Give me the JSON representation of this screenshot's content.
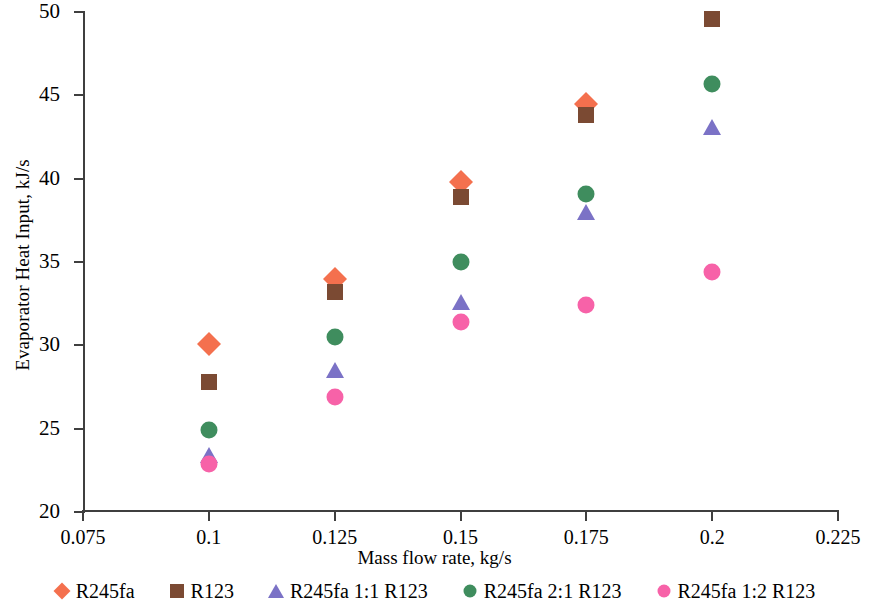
{
  "chart_data": {
    "type": "scatter",
    "title": "",
    "xlabel": "Mass flow rate, kg/s",
    "ylabel": "Evaporator Heat Input, kJ/s",
    "xlim": [
      0.075,
      0.225
    ],
    "ylim": [
      20,
      50
    ],
    "xticks": [
      "0.075",
      "0.1",
      "0.125",
      "0.15",
      "0.175",
      "0.2",
      "0.225"
    ],
    "xtick_values": [
      0.075,
      0.1,
      0.125,
      0.15,
      0.175,
      0.2,
      0.225
    ],
    "yticks": [
      "20",
      "25",
      "30",
      "35",
      "40",
      "45",
      "50"
    ],
    "ytick_values": [
      20,
      25,
      30,
      35,
      40,
      45,
      50
    ],
    "grid": false,
    "legend_position": "bottom",
    "x": [
      0.1,
      0.125,
      0.15,
      0.175,
      0.2
    ],
    "series": [
      {
        "name": "R245fa",
        "marker": "diamond",
        "color": "#F4704E",
        "values": [
          30.1,
          34.0,
          39.8,
          44.5,
          null
        ]
      },
      {
        "name": "R123",
        "marker": "square",
        "color": "#7B4A33",
        "values": [
          27.8,
          33.2,
          38.9,
          43.8,
          49.6
        ]
      },
      {
        "name": "R245fa 1:1 R123",
        "marker": "triangle",
        "color": "#7B72C6",
        "values": [
          23.3,
          28.4,
          32.5,
          37.9,
          43.0
        ]
      },
      {
        "name": "R245fa 2:1 R123",
        "marker": "circle",
        "color": "#3F8D5E",
        "values": [
          24.9,
          30.5,
          35.0,
          39.1,
          45.7
        ]
      },
      {
        "name": "R245fa 1:2 R123",
        "marker": "circle",
        "color": "#F762A8",
        "values": [
          22.9,
          26.9,
          31.4,
          32.4,
          34.4
        ]
      }
    ]
  },
  "axis": {
    "line_color": "#3f3f3f"
  }
}
